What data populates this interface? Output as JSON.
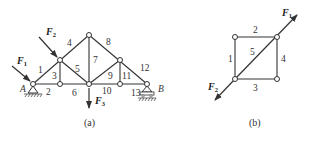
{
  "figure_a": {
    "caption": "(a)",
    "support_labels": {
      "left": "A",
      "right": "B"
    },
    "member_labels": [
      "1",
      "2",
      "3",
      "4",
      "5",
      "6",
      "7",
      "8",
      "9",
      "10",
      "11",
      "12",
      "13"
    ],
    "forces": [
      {
        "symbol": "F",
        "sub": "1"
      },
      {
        "symbol": "F",
        "sub": "2"
      },
      {
        "symbol": "F",
        "sub": "3"
      }
    ]
  },
  "figure_b": {
    "caption": "(b)",
    "member_labels": [
      "1",
      "2",
      "3",
      "4",
      "5"
    ],
    "forces": [
      {
        "symbol": "F",
        "sub": "1"
      },
      {
        "symbol": "F",
        "sub": "2"
      }
    ]
  }
}
